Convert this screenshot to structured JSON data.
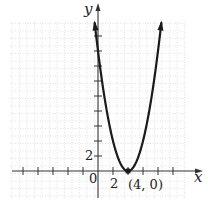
{
  "chart_data": {
    "type": "line",
    "title": "",
    "xlabel": "x",
    "ylabel": "y",
    "function": "y = (x - 4)^2",
    "x_tick_step": 2,
    "y_tick_step": 2,
    "x_tick_labels": [
      "0",
      "2"
    ],
    "y_tick_labels": [
      "2"
    ],
    "xlim": [
      -12,
      14
    ],
    "ylim": [
      -4,
      20
    ],
    "grid": true,
    "series": [
      {
        "name": "parabola",
        "x": [
          -0.4,
          0,
          1,
          2,
          3,
          4,
          5,
          6,
          7,
          8,
          8.4
        ],
        "y": [
          19.4,
          16,
          9,
          4,
          1,
          0,
          1,
          4,
          9,
          16,
          19.4
        ]
      }
    ],
    "annotations": [
      {
        "text": "(4, 0)",
        "x": 4,
        "y": 0,
        "marker": "point"
      }
    ]
  },
  "labels": {
    "x_axis": "x",
    "y_axis": "y",
    "origin": "0",
    "x_tick_2": "2",
    "y_tick_2": "2",
    "vertex": "(4, 0)"
  },
  "colors": {
    "curve": "#1a1a1a",
    "axis": "#333333",
    "grid": "#d0d0d0"
  }
}
